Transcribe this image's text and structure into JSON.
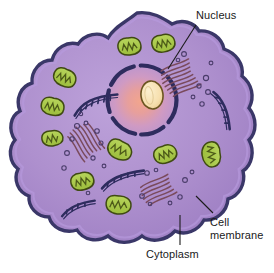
{
  "diagram": {
    "type": "biological-cell-diagram",
    "background_color": "#ffffff",
    "labels": {
      "nucleus": "Nucleus",
      "cell_membrane_line1": "Cell",
      "cell_membrane_line2": "membrane",
      "cytoplasm": "Cytoplasm"
    },
    "colors": {
      "cytoplasm_fill": "#a98ccc",
      "cytoplasm_fill_light": "#b99ed8",
      "membrane_outline": "#3a3768",
      "membrane_inner_band": "#9d7fc4",
      "nucleus_envelope": "#2e2c5e",
      "nucleus_interior_center": "#f4a08c",
      "nucleus_interior_mid": "#d39ac0",
      "nucleus_interior_edge": "#b193d4",
      "nucleolus_fill": "#f7e2b4",
      "nucleolus_outline": "#6b5520",
      "mitochondria_fill": "#a8c84a",
      "mitochondria_outline": "#3f4a12",
      "mitochondria_cristae": "#4c5a18",
      "er_line": "#7a4a5c",
      "golgi_line": "#2e2c5e",
      "vesicle_outline": "#4a3c6a",
      "label_text": "#1a1a1a",
      "leader_line": "#1a1a1a"
    },
    "organelles": [
      {
        "name": "nucleus",
        "count": 1,
        "description": "large central sphere with dashed dark envelope and radial pink interior"
      },
      {
        "name": "nucleolus",
        "count": 1,
        "description": "cream oval inside nucleus"
      },
      {
        "name": "mitochondria",
        "count": 10,
        "description": "green bean-shaped bodies with internal cristae"
      },
      {
        "name": "endoplasmic-reticulum",
        "count": 3,
        "description": "stacks of maroon parallel membranes with ribosome vesicles"
      },
      {
        "name": "golgi-apparatus",
        "count": 4,
        "description": "dark navy curved stacks with spikes"
      },
      {
        "name": "vesicles",
        "count": 26,
        "description": "small open circles scattered in cytoplasm"
      }
    ]
  }
}
